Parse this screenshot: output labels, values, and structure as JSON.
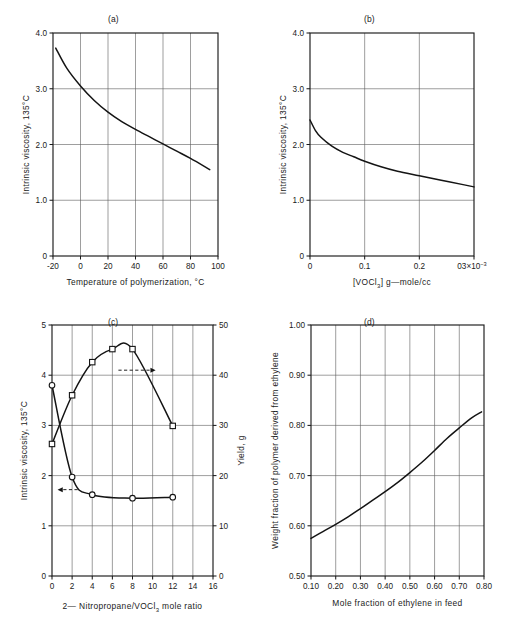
{
  "figure": {
    "background": "#ffffff",
    "ink_color": "#141414",
    "grid_color": "#5d5d5d"
  },
  "panels": [
    {
      "id": "panel-a",
      "caption": "(a)",
      "xlabel": "Temperature of polymerization, °C",
      "ylabel": "Intrinsic viscosity, 135°C"
    },
    {
      "id": "panel-b",
      "caption": "(b)",
      "xlabel_pre": "[VOCl",
      "xlabel_sub": "3",
      "xlabel_post": "]  g—mole/cc",
      "ylabel": "Intrinsic viscosity, 135°C"
    },
    {
      "id": "panel-c",
      "caption": "(c)",
      "xlabel_pre": "2— Nitropropane/VOCl",
      "xlabel_sub": "3",
      "xlabel_post": " mole ratio",
      "ylabel_left": "Intrinsic viscosity, 135°C",
      "ylabel_right": "Yield, g"
    },
    {
      "id": "panel-d",
      "caption": "(d)",
      "xlabel": "Mole fraction of ethylene in feed",
      "ylabel": "Weight fraction of polymer derived from ethylene"
    }
  ],
  "chart_data": [
    {
      "type": "line",
      "panel": "a",
      "title": "(a)",
      "xlabel": "Temperature of polymerization, °C",
      "ylabel": "Intrinsic viscosity, 135°C",
      "xlim": [
        -20,
        100
      ],
      "ylim": [
        0,
        4.0
      ],
      "xticks": [
        -20,
        0,
        20,
        40,
        60,
        80,
        100
      ],
      "xtick_labels": [
        "-20",
        "0",
        "20",
        "40",
        "60",
        "80",
        "100"
      ],
      "yticks": [
        0,
        1.0,
        2.0,
        3.0,
        4.0
      ],
      "ytick_labels": [
        "0",
        "1.0",
        "2.0",
        "3.0",
        "4.0"
      ],
      "grid": true,
      "legend": null,
      "series": [
        {
          "name": "Intrinsic viscosity vs temperature",
          "x": [
            -18,
            -10,
            0,
            10,
            20,
            30,
            40,
            50,
            60,
            70,
            80,
            94
          ],
          "y": [
            3.73,
            3.37,
            3.05,
            2.79,
            2.58,
            2.41,
            2.27,
            2.14,
            2.01,
            1.88,
            1.75,
            1.55
          ]
        }
      ]
    },
    {
      "type": "line",
      "panel": "b",
      "title": "(b)",
      "xlabel": "[VOCl3]  g—mole/cc",
      "ylabel": "Intrinsic viscosity, 135°C",
      "xlim": [
        0,
        0.3
      ],
      "ylim": [
        0,
        4.0
      ],
      "xticks": [
        0,
        0.1,
        0.2,
        0.3
      ],
      "xtick_labels": [
        "0",
        "0.1",
        "0.2",
        "03×10-3"
      ],
      "yticks": [
        0,
        1.0,
        2.0,
        3.0,
        4.0
      ],
      "ytick_labels": [
        "0",
        "1.0",
        "2.0",
        "3.0",
        "4.0"
      ],
      "grid": true,
      "legend": null,
      "series": [
        {
          "name": "Intrinsic viscosity vs catalyst concentration",
          "x": [
            0.0,
            0.01,
            0.02,
            0.04,
            0.06,
            0.08,
            0.1,
            0.13,
            0.16,
            0.2,
            0.24,
            0.28,
            0.3
          ],
          "y": [
            2.44,
            2.25,
            2.13,
            1.97,
            1.86,
            1.78,
            1.7,
            1.6,
            1.52,
            1.44,
            1.36,
            1.28,
            1.24
          ]
        }
      ]
    },
    {
      "type": "line",
      "panel": "c",
      "title": "(c)",
      "xlabel": "2— Nitropropane/VOCl3 mole ratio",
      "ylabel_left": "Intrinsic viscosity, 135°C",
      "ylabel_right": "Yield, g",
      "xlim": [
        0,
        16
      ],
      "ylim_left": [
        0,
        5
      ],
      "ylim_right": [
        0,
        50
      ],
      "xticks": [
        0,
        2,
        4,
        6,
        8,
        10,
        12,
        14,
        16
      ],
      "xtick_labels": [
        "0",
        "2",
        "4",
        "6",
        "8",
        "10",
        "12",
        "14",
        "16"
      ],
      "yticks_left": [
        0,
        1,
        2,
        3,
        4,
        5
      ],
      "ytick_labels_left": [
        "0",
        "1",
        "2",
        "3",
        "4",
        "5"
      ],
      "yticks_right": [
        0,
        10,
        20,
        30,
        40,
        50
      ],
      "ytick_labels_right": [
        "0",
        "10",
        "20",
        "30",
        "40",
        "50"
      ],
      "grid": true,
      "annotations": [
        {
          "text": "arrow pointing to left axis",
          "x": 1.55,
          "y_left": 1.72,
          "direction": "left"
        },
        {
          "text": "arrow pointing to right axis",
          "x": 8.6,
          "y_right": 41.0,
          "direction": "right"
        }
      ],
      "series": [
        {
          "name": "Intrinsic viscosity, 135°C",
          "axis": "left",
          "marker": "circle",
          "x": [
            0,
            2,
            4,
            8,
            12
          ],
          "y": [
            3.8,
            1.97,
            1.62,
            1.55,
            1.57
          ]
        },
        {
          "name": "Yield, g",
          "axis": "right",
          "marker": "square",
          "x": [
            0,
            2,
            4,
            6,
            8,
            12
          ],
          "y": [
            26.3,
            36.0,
            42.6,
            45.2,
            45.2,
            29.9
          ]
        }
      ]
    },
    {
      "type": "line",
      "panel": "d",
      "title": "(d)",
      "xlabel": "Mole fraction of ethylene in feed",
      "ylabel": "Weight fraction of polymer derived from ethylene",
      "xlim": [
        0.1,
        0.8
      ],
      "ylim": [
        0.5,
        1.0
      ],
      "xticks": [
        0.1,
        0.2,
        0.3,
        0.4,
        0.5,
        0.6,
        0.7,
        0.8
      ],
      "xtick_labels": [
        "0.10",
        "0.20",
        "0.30",
        "0.40",
        "0.50",
        "0.60",
        "0.70",
        "0.80"
      ],
      "yticks": [
        0.5,
        0.6,
        0.7,
        0.8,
        0.9,
        1.0
      ],
      "ytick_labels": [
        "0.50",
        "0.60",
        "0.70",
        "0.80",
        "0.90",
        "1.00"
      ],
      "grid": true,
      "legend": null,
      "series": [
        {
          "name": "Weight fraction of polymer derived from ethylene",
          "x": [
            0.1,
            0.15,
            0.2,
            0.25,
            0.3,
            0.35,
            0.4,
            0.45,
            0.5,
            0.55,
            0.6,
            0.65,
            0.7,
            0.75,
            0.79
          ],
          "y": [
            0.575,
            0.589,
            0.603,
            0.618,
            0.634,
            0.651,
            0.668,
            0.686,
            0.706,
            0.727,
            0.75,
            0.774,
            0.795,
            0.815,
            0.827
          ]
        }
      ]
    }
  ]
}
